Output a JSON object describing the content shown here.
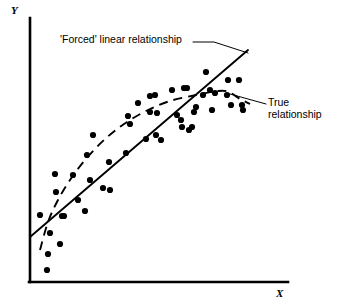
{
  "figure": {
    "width": 345,
    "height": 308,
    "background": "#ffffff",
    "ink_color": "#000000"
  },
  "axes": {
    "y_label": "Y",
    "x_label": "X",
    "origin": [
      30,
      282
    ],
    "y_axis_top": [
      30,
      18
    ],
    "x_axis_right": [
      288,
      282
    ],
    "axis_stroke_width": 2.6
  },
  "annotations": [
    {
      "name": "forced-linear-relationship-label",
      "text": "'Forced' linear relationship",
      "position": [
        60,
        33
      ],
      "leader_line": [
        [
          193,
          42
        ],
        [
          214,
          42
        ],
        [
          248,
          53
        ]
      ]
    },
    {
      "name": "true-relationship-label",
      "line1": "True",
      "line2": "relationship",
      "position": [
        268,
        96
      ],
      "leader_line": [
        [
          230,
          94
        ],
        [
          266,
          104
        ]
      ]
    }
  ],
  "chart_data": {
    "type": "scatter",
    "title": "",
    "xlabel": "X",
    "ylabel": "Y",
    "grid": false,
    "legend": "none",
    "point_radius": 3.1,
    "point_color": "#000000",
    "points": [
      [
        40,
        215
      ],
      [
        47,
        270
      ],
      [
        48,
        254
      ],
      [
        50,
        233
      ],
      [
        55,
        174
      ],
      [
        56,
        192
      ],
      [
        60,
        244
      ],
      [
        62,
        216
      ],
      [
        64,
        216
      ],
      [
        73,
        175
      ],
      [
        78,
        200
      ],
      [
        85,
        211
      ],
      [
        87,
        155
      ],
      [
        90,
        180
      ],
      [
        93,
        135
      ],
      [
        103,
        188
      ],
      [
        109,
        162
      ],
      [
        110,
        190
      ],
      [
        126,
        153
      ],
      [
        128,
        116
      ],
      [
        130,
        124
      ],
      [
        138,
        103
      ],
      [
        146,
        139
      ],
      [
        150,
        96
      ],
      [
        150,
        112
      ],
      [
        155,
        95
      ],
      [
        156,
        135
      ],
      [
        157,
        113
      ],
      [
        161,
        140
      ],
      [
        172,
        90
      ],
      [
        177,
        115
      ],
      [
        181,
        120
      ],
      [
        182,
        127
      ],
      [
        184,
        88
      ],
      [
        187,
        88
      ],
      [
        189,
        130
      ],
      [
        192,
        127
      ],
      [
        194,
        112
      ],
      [
        196,
        107
      ],
      [
        203,
        95
      ],
      [
        206,
        72
      ],
      [
        210,
        90
      ],
      [
        212,
        110
      ],
      [
        215,
        93
      ],
      [
        227,
        95
      ],
      [
        228,
        80
      ],
      [
        231,
        105
      ],
      [
        239,
        80
      ],
      [
        242,
        105
      ],
      [
        243,
        110
      ]
    ],
    "series": [
      {
        "name": "'Forced' linear relationship",
        "type": "line",
        "style": "solid",
        "stroke_width": 1.9,
        "path": [
          [
            30,
            237
          ],
          [
            248,
            50
          ]
        ]
      },
      {
        "name": "True relationship",
        "type": "line",
        "style": "dashed",
        "stroke_width": 1.9,
        "dash_pattern": "9 6",
        "path": [
          [
            40,
            250
          ],
          [
            48,
            222
          ],
          [
            58,
            200
          ],
          [
            70,
            180
          ],
          [
            85,
            160
          ],
          [
            104,
            140
          ],
          [
            124,
            124
          ],
          [
            146,
            111
          ],
          [
            170,
            101
          ],
          [
            196,
            95
          ],
          [
            218,
            91
          ],
          [
            229,
            92
          ],
          [
            240,
            99
          ],
          [
            250,
            104
          ]
        ]
      }
    ]
  }
}
